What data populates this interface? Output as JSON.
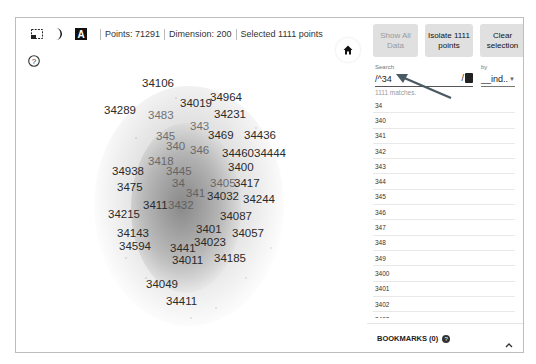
{
  "toolbar": {
    "icons": [
      "select-rectangle-icon",
      "night-mode-icon",
      "label-toggle-icon"
    ],
    "points": "Points: 71291",
    "dimension": "Dimension: 200",
    "selected": "Selected 1111 points"
  },
  "projector": {
    "help_icon": "help-circle-icon",
    "home_icon": "home-icon",
    "labels": [
      {
        "text": "34106",
        "x": 142,
        "y": 83,
        "dim": false
      },
      {
        "text": "34964",
        "x": 210,
        "y": 97,
        "dim": false
      },
      {
        "text": "34019",
        "x": 180,
        "y": 103,
        "dim": false
      },
      {
        "text": "34289",
        "x": 104,
        "y": 110,
        "dim": false
      },
      {
        "text": "3483",
        "x": 148,
        "y": 115,
        "dim": true
      },
      {
        "text": "34231",
        "x": 214,
        "y": 114,
        "dim": false
      },
      {
        "text": "343",
        "x": 190,
        "y": 126,
        "dim": true
      },
      {
        "text": "3469",
        "x": 208,
        "y": 135,
        "dim": false
      },
      {
        "text": "34436",
        "x": 244,
        "y": 135,
        "dim": false
      },
      {
        "text": "345",
        "x": 156,
        "y": 136,
        "dim": true
      },
      {
        "text": "340",
        "x": 166,
        "y": 146,
        "dim": true
      },
      {
        "text": "346",
        "x": 190,
        "y": 150,
        "dim": true
      },
      {
        "text": "34460",
        "x": 222,
        "y": 153,
        "dim": false
      },
      {
        "text": "34444",
        "x": 254,
        "y": 153,
        "dim": false
      },
      {
        "text": "3418",
        "x": 148,
        "y": 161,
        "dim": true
      },
      {
        "text": "3400",
        "x": 228,
        "y": 167,
        "dim": false
      },
      {
        "text": "34938",
        "x": 112,
        "y": 171,
        "dim": false
      },
      {
        "text": "3445",
        "x": 166,
        "y": 171,
        "dim": true
      },
      {
        "text": "34",
        "x": 172,
        "y": 183,
        "dim": true
      },
      {
        "text": "3405",
        "x": 210,
        "y": 183,
        "dim": true
      },
      {
        "text": "3475",
        "x": 117,
        "y": 187,
        "dim": false
      },
      {
        "text": "3417",
        "x": 234,
        "y": 183,
        "dim": false
      },
      {
        "text": "341",
        "x": 186,
        "y": 193,
        "dim": true
      },
      {
        "text": "34032",
        "x": 207,
        "y": 196,
        "dim": false
      },
      {
        "text": "34244",
        "x": 243,
        "y": 199,
        "dim": false
      },
      {
        "text": "3411",
        "x": 143,
        "y": 205,
        "dim": false
      },
      {
        "text": "3432",
        "x": 168,
        "y": 205,
        "dim": true
      },
      {
        "text": "34215",
        "x": 108,
        "y": 214,
        "dim": false
      },
      {
        "text": "34087",
        "x": 220,
        "y": 216,
        "dim": false
      },
      {
        "text": "3401",
        "x": 196,
        "y": 229,
        "dim": false
      },
      {
        "text": "34057",
        "x": 232,
        "y": 233,
        "dim": false
      },
      {
        "text": "34143",
        "x": 117,
        "y": 233,
        "dim": false
      },
      {
        "text": "34023",
        "x": 194,
        "y": 242,
        "dim": false
      },
      {
        "text": "34594",
        "x": 119,
        "y": 246,
        "dim": false
      },
      {
        "text": "3441",
        "x": 170,
        "y": 248,
        "dim": false
      },
      {
        "text": "34011",
        "x": 172,
        "y": 260,
        "dim": false
      },
      {
        "text": "34185",
        "x": 214,
        "y": 258,
        "dim": false
      },
      {
        "text": "34049",
        "x": 146,
        "y": 284,
        "dim": false
      },
      {
        "text": "34411",
        "x": 166,
        "y": 301,
        "dim": false
      }
    ]
  },
  "panel": {
    "buttons": {
      "show_all": "Show All Data",
      "isolate": "Isolate 1111 points",
      "clear": "Clear selection"
    },
    "search": {
      "label": "Search",
      "value": "/^34",
      "regex_marker": "/",
      "matches": "1111 matches."
    },
    "by": {
      "label": "by",
      "value": "__ind.."
    },
    "results": [
      "34",
      "340",
      "341",
      "342",
      "343",
      "344",
      "345",
      "346",
      "347",
      "348",
      "349",
      "3400",
      "3401",
      "3402",
      "3403"
    ],
    "bookmarks": {
      "label": "BOOKMARKS (0)",
      "help_icon": "help-icon",
      "toggle_icon": "chevron-up-icon"
    }
  },
  "annotation": {
    "arrow_color": "#4a5a63"
  }
}
